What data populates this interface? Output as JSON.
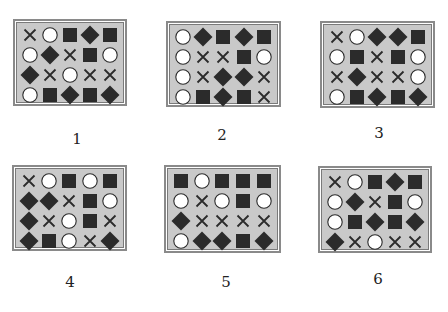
{
  "legend": {
    "X": "cross-icon",
    "O": "circle-icon",
    "S": "square-icon",
    "D": "diamond-icon"
  },
  "colors": {
    "fill": "#c9c9c9",
    "shape_dark": "#2b2b2b",
    "circle_fill": "#ffffff"
  },
  "panels": [
    {
      "label": "1",
      "grid": [
        [
          "X",
          "O",
          "S",
          "D",
          "S"
        ],
        [
          "O",
          "D",
          "X",
          "S",
          "O"
        ],
        [
          "D",
          "X",
          "O",
          "X",
          "X"
        ],
        [
          "O",
          "S",
          "D",
          "S",
          "D"
        ]
      ]
    },
    {
      "label": "2",
      "grid": [
        [
          "O",
          "D",
          "S",
          "D",
          "S"
        ],
        [
          "O",
          "X",
          "X",
          "S",
          "O"
        ],
        [
          "O",
          "X",
          "D",
          "D",
          "X"
        ],
        [
          "O",
          "S",
          "D",
          "S",
          "X"
        ]
      ]
    },
    {
      "label": "3",
      "grid": [
        [
          "X",
          "O",
          "D",
          "D",
          "S"
        ],
        [
          "O",
          "S",
          "X",
          "S",
          "O"
        ],
        [
          "X",
          "D",
          "X",
          "X",
          "O"
        ],
        [
          "O",
          "S",
          "D",
          "S",
          "D"
        ]
      ]
    },
    {
      "label": "4",
      "grid": [
        [
          "X",
          "O",
          "S",
          "O",
          "S"
        ],
        [
          "D",
          "D",
          "X",
          "S",
          "O"
        ],
        [
          "D",
          "X",
          "O",
          "S",
          "X"
        ],
        [
          "D",
          "S",
          "O",
          "X",
          "D"
        ]
      ]
    },
    {
      "label": "5",
      "grid": [
        [
          "S",
          "O",
          "S",
          "S",
          "S"
        ],
        [
          "O",
          "X",
          "O",
          "S",
          "O"
        ],
        [
          "D",
          "X",
          "X",
          "X",
          "X"
        ],
        [
          "O",
          "D",
          "D",
          "S",
          "D"
        ]
      ]
    },
    {
      "label": "6",
      "grid": [
        [
          "X",
          "O",
          "S",
          "D",
          "S"
        ],
        [
          "O",
          "D",
          "X",
          "S",
          "O"
        ],
        [
          "O",
          "S",
          "D",
          "S",
          "D"
        ],
        [
          "D",
          "X",
          "O",
          "X",
          "X"
        ]
      ]
    }
  ]
}
